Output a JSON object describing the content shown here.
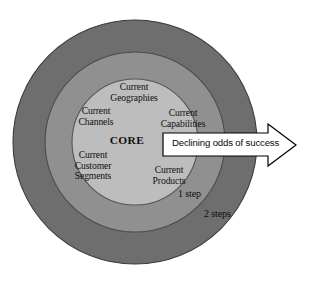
{
  "figure": {
    "type": "concentric-rings-diagram",
    "background_color": "#ffffff"
  },
  "rings": {
    "outer": {
      "name": "2 steps ring",
      "label": "2 steps",
      "fill": "#6e6e6e",
      "stroke": "#3d3d3d",
      "center": [
        135,
        142
      ],
      "radius": 122
    },
    "middle": {
      "name": "1 step ring",
      "label": "1 step",
      "fill": "#909090",
      "stroke": "#4a4a4a",
      "center": [
        135,
        142
      ],
      "radius": 90
    },
    "inner": {
      "name": "core circle",
      "label": "CORE",
      "fill": "#bdbdbd",
      "stroke": "#555555",
      "center": [
        135,
        142
      ],
      "radius": 63
    }
  },
  "core": {
    "label": "CORE"
  },
  "core_items": [
    {
      "id": "geographies",
      "label": "Current\nGeographies"
    },
    {
      "id": "channels",
      "label": "Current\nChannels"
    },
    {
      "id": "capabilities",
      "label": "Current\nCapabilities"
    },
    {
      "id": "segments",
      "label": "Current\nCustomer\nSegments"
    },
    {
      "id": "products",
      "label": "Current\nProducts"
    }
  ],
  "arrow": {
    "label": "Declining odds of success",
    "fill": "#ffffff",
    "stroke": "#000000",
    "direction": "right"
  }
}
